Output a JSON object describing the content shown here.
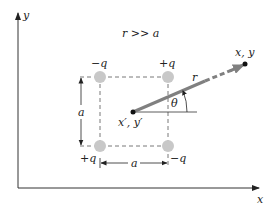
{
  "diagram": {
    "axes": {
      "x_label": "x",
      "y_label": "y"
    },
    "condition": "r >> a",
    "charges": [
      {
        "position": "top-left",
        "label": "−q",
        "sign": "negative"
      },
      {
        "position": "top-right",
        "label": "+q",
        "sign": "positive"
      },
      {
        "position": "bottom-left",
        "label": "+q",
        "sign": "positive"
      },
      {
        "position": "bottom-right",
        "label": "−q",
        "sign": "negative"
      }
    ],
    "dimensions": {
      "vertical_side": "a",
      "horizontal_side": "a"
    },
    "source_point": "x′, y′",
    "field_point": "x, y",
    "distance_label": "r",
    "angle_label": "θ",
    "colors": {
      "charge_fill": "#c8c8c8",
      "vector": "#808080",
      "lines": "#333333"
    }
  }
}
